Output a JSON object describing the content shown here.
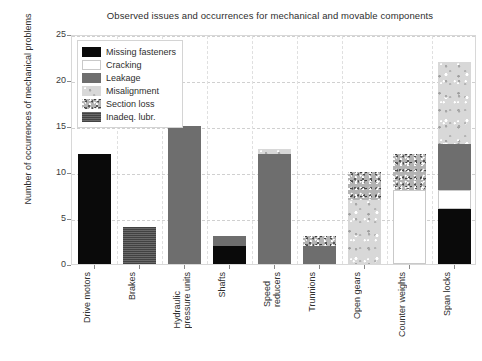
{
  "chart_data": {
    "type": "bar",
    "stacked": true,
    "title": "Observed issues and occurrences for mechanical and movable components",
    "xlabel": "",
    "ylabel": "Number of occurrences of mechanical problems",
    "ylim": [
      0,
      25
    ],
    "yticks": [
      0,
      5,
      10,
      15,
      20,
      25
    ],
    "grid": "horizontal-and-vertical-dashed",
    "legend_position": "upper-left-inside",
    "categories": [
      "Drive motors",
      "Brakes",
      "Hydraulic\npressure units",
      "Shafts",
      "Speed\nreducers",
      "Trunnions",
      "Open gears",
      "Counter weights",
      "Span locks"
    ],
    "series": [
      {
        "name": "Missing fasteners",
        "key": "missing_fasteners",
        "color": "#0a0a0a",
        "values": [
          12,
          0,
          0,
          2,
          0,
          0,
          0,
          0,
          6
        ]
      },
      {
        "name": "Cracking",
        "key": "cracking",
        "color": "#ffffff",
        "values": [
          0,
          0,
          0,
          0,
          0,
          0,
          0,
          8,
          2
        ]
      },
      {
        "name": "Leakage",
        "key": "leakage",
        "color": "#6e6e6e",
        "values": [
          0,
          0,
          15,
          1,
          12,
          2,
          0,
          0,
          5
        ]
      },
      {
        "name": "Misalignment",
        "key": "misalignment",
        "color": "#d8d8d8",
        "values": [
          0,
          0,
          0,
          0,
          0.5,
          0,
          7,
          0,
          9
        ]
      },
      {
        "name": "Section loss",
        "key": "section_loss",
        "color": "#b3b3b3",
        "values": [
          0,
          0,
          0,
          0,
          0,
          1,
          3,
          4,
          0
        ]
      },
      {
        "name": "Inadeq. lubr.",
        "key": "inadeq_lubr",
        "color": "#545454",
        "values": [
          0,
          4,
          0,
          0,
          0,
          0,
          0,
          0,
          0
        ]
      }
    ],
    "totals": [
      12,
      4,
      15,
      3,
      12.5,
      3,
      10,
      12,
      22
    ]
  }
}
